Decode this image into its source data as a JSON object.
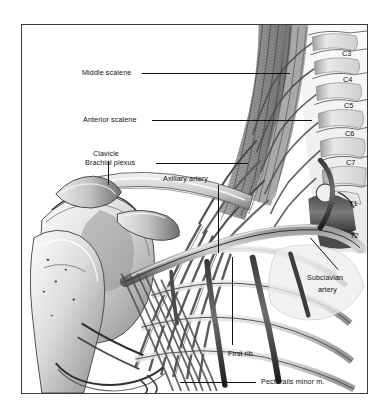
{
  "figure": {
    "kind": "anatomical-illustration",
    "style": "grayscale pen-and-ink medical illustration",
    "background_color": "#ffffff",
    "frame_color": "#3a3a3a",
    "text_color": "#111111",
    "leader_color": "#101010"
  },
  "labels": [
    {
      "id": "middle-scalene",
      "text": "Middle scalene"
    },
    {
      "id": "anterior-scalene",
      "text": "Anterior scalene"
    },
    {
      "id": "brachial-plexus",
      "text": "Brachial plexus"
    },
    {
      "id": "axillary-artery",
      "text": "Axillary artery"
    },
    {
      "id": "clavicle",
      "text": "Clavicle"
    },
    {
      "id": "subclavian-line1",
      "text": "Subclavian"
    },
    {
      "id": "subclavian-line2",
      "text": "artery"
    },
    {
      "id": "first-rib",
      "text": "First rib"
    },
    {
      "id": "pectoralis-minor",
      "text": "Pectoralis minor m."
    }
  ],
  "vertebrae": [
    {
      "id": "c3",
      "text": "C3"
    },
    {
      "id": "c4",
      "text": "C4"
    },
    {
      "id": "c5",
      "text": "C5"
    },
    {
      "id": "c6",
      "text": "C6"
    },
    {
      "id": "c7",
      "text": "C7"
    },
    {
      "id": "t1",
      "text": "T1"
    },
    {
      "id": "t2",
      "text": "T2"
    }
  ]
}
